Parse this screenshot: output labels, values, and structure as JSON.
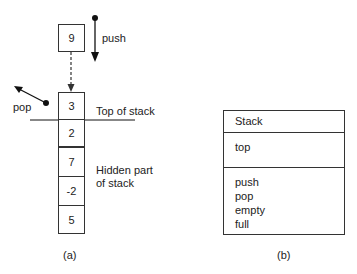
{
  "figure_a": {
    "incoming_value": "9",
    "push_label": "push",
    "pop_label": "pop",
    "top_label": "Top of stack",
    "hidden_label_line1": "Hidden part",
    "hidden_label_line2": "of stack",
    "stack_values": [
      "3",
      "2",
      "7",
      "-2",
      "5"
    ],
    "caption": "(a)"
  },
  "figure_b": {
    "class_name": "Stack",
    "attributes": [
      "top"
    ],
    "operations": [
      "push",
      "pop",
      "empty",
      "full"
    ],
    "caption": "(b)"
  }
}
